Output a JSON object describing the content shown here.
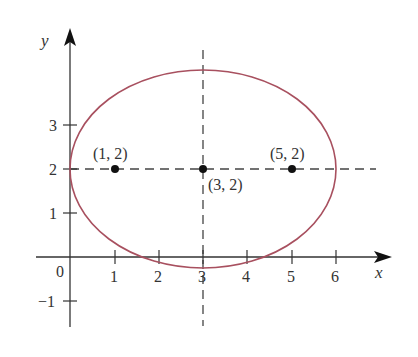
{
  "diagram": {
    "type": "ellipse-graph",
    "equation_center": [
      3,
      2
    ],
    "semi_major_axis": 3,
    "semi_minor_axis": 2.236,
    "foci": [
      [
        1,
        2
      ],
      [
        5,
        2
      ]
    ],
    "curve_color": "#a8505f",
    "axis_color": "#333333",
    "dash_color": "#444444"
  },
  "axes": {
    "x_label": "x",
    "y_label": "y",
    "origin_label": "0",
    "x_ticks": [
      "1",
      "2",
      "3",
      "4",
      "5",
      "6"
    ],
    "y_ticks": [
      "3",
      "2",
      "1",
      "−1"
    ]
  },
  "points": [
    {
      "label": "(1, 2)",
      "x": 1,
      "y": 2
    },
    {
      "label": "(3, 2)",
      "x": 3,
      "y": 2
    },
    {
      "label": "(5, 2)",
      "x": 5,
      "y": 2
    }
  ]
}
